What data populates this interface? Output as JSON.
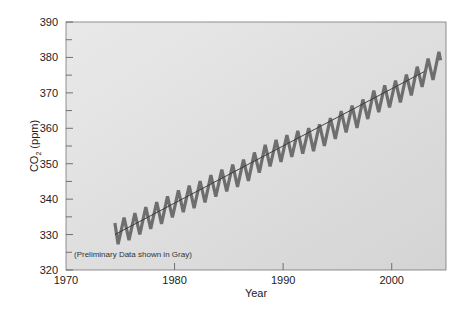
{
  "chart_data": {
    "type": "line",
    "title": "",
    "xlabel": "Year",
    "ylabel": "CO2 (ppm)",
    "xlim": [
      1970,
      2005
    ],
    "ylim": [
      320,
      390
    ],
    "xticks": [
      1970,
      1980,
      1990,
      2000
    ],
    "yticks": [
      320,
      330,
      340,
      350,
      360,
      370,
      380,
      390
    ],
    "grid": false,
    "annotation": "(Preliminary Data shown in Gray)",
    "series": [
      {
        "name": "Monthly CO2 (seasonal cycle)",
        "style": "thick gray zigzag",
        "seasonal_amplitude_ppm": 3.4,
        "x": [
          1974.5,
          1975,
          1976,
          1977,
          1978,
          1979,
          1980,
          1981,
          1982,
          1983,
          1984,
          1985,
          1986,
          1987,
          1988,
          1989,
          1990,
          1991,
          1992,
          1993,
          1994,
          1995,
          1996,
          1997,
          1998,
          1999,
          2000,
          2001,
          2002,
          2003,
          2004,
          2004.5
        ],
        "trend": [
          330.2,
          331.0,
          332.0,
          333.8,
          335.3,
          336.7,
          338.6,
          340.0,
          341.1,
          342.8,
          344.4,
          345.9,
          347.1,
          348.9,
          351.4,
          352.9,
          354.2,
          355.6,
          356.4,
          357.1,
          358.8,
          360.8,
          362.6,
          363.7,
          366.6,
          368.3,
          369.5,
          371.0,
          373.1,
          375.6,
          377.4,
          378.5
        ]
      },
      {
        "name": "Annual trend",
        "style": "thin dark line",
        "x": [
          1974.5,
          2003
        ],
        "y": [
          330.0,
          376.0
        ]
      }
    ]
  },
  "labels": {
    "ylabel_main": "CO",
    "ylabel_sub": "2",
    "ylabel_unit": " (ppm)",
    "xlabel": "Year",
    "note": "(Preliminary Data shown in Gray)"
  }
}
